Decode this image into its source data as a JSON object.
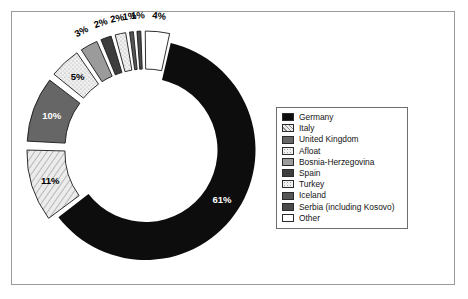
{
  "chart_data": {
    "type": "pie",
    "variant": "doughnut-exploded",
    "title": "",
    "xlabel": "",
    "ylabel": "",
    "units": "percent",
    "categories": [
      "Germany",
      "Italy",
      "United Kingdom",
      "Afloat",
      "Bosnia-Herzegovina",
      "Spain",
      "Turkey",
      "Iceland",
      "Serbia (including Kosovo)",
      "Other"
    ],
    "values": [
      61,
      11,
      10,
      5,
      3,
      2,
      2,
      1,
      1,
      4
    ],
    "data_labels": [
      "61%",
      "11%",
      "10%",
      "5%",
      "3%",
      "2%",
      "2%",
      "1%",
      "1%",
      "4%"
    ],
    "legend_position": "right",
    "grid": false,
    "slices": [
      {
        "label": "Germany",
        "value": 61,
        "data_label": "61%",
        "fill": "#0d0d0d",
        "pattern": "solid",
        "label_color": "light",
        "exploded": false
      },
      {
        "label": "Italy",
        "value": 11,
        "data_label": "11%",
        "fill": "#e8e8e8",
        "pattern": "diagonal-lines",
        "label_color": "dark",
        "exploded": true
      },
      {
        "label": "United Kingdom",
        "value": 10,
        "data_label": "10%",
        "fill": "#666666",
        "pattern": "solid",
        "label_color": "light",
        "exploded": true
      },
      {
        "label": "Afloat",
        "value": 5,
        "data_label": "5%",
        "fill": "#ececec",
        "pattern": "speckle",
        "label_color": "dark",
        "exploded": true
      },
      {
        "label": "Bosnia-Herzegovina",
        "value": 3,
        "data_label": "3%",
        "fill": "#9b9b9b",
        "pattern": "solid",
        "label_color": "dark",
        "exploded": true
      },
      {
        "label": "Spain",
        "value": 2,
        "data_label": "2%",
        "fill": "#3d3d3d",
        "pattern": "solid",
        "label_color": "dark",
        "exploded": true
      },
      {
        "label": "Turkey",
        "value": 2,
        "data_label": "2%",
        "fill": "#efefef",
        "pattern": "speckle",
        "label_color": "dark",
        "exploded": true
      },
      {
        "label": "Iceland",
        "value": 1,
        "data_label": "1%",
        "fill": "#565656",
        "pattern": "solid",
        "label_color": "dark",
        "exploded": true
      },
      {
        "label": "Serbia (including Kosovo)",
        "value": 1,
        "data_label": "1%",
        "fill": "#4a4a4a",
        "pattern": "solid",
        "label_color": "dark",
        "exploded": true
      },
      {
        "label": "Other",
        "value": 4,
        "data_label": "4%",
        "fill": "#ffffff",
        "pattern": "none",
        "label_color": "dark",
        "exploded": true
      }
    ]
  },
  "legend": {
    "items": [
      {
        "label": "Germany",
        "fill": "#0d0d0d",
        "pattern": "solid"
      },
      {
        "label": "Italy",
        "fill": "#e8e8e8",
        "pattern": "diagonal-lines"
      },
      {
        "label": "United Kingdom",
        "fill": "#666666",
        "pattern": "solid"
      },
      {
        "label": "Afloat",
        "fill": "#ececec",
        "pattern": "speckle"
      },
      {
        "label": "Bosnia-Herzegovina",
        "fill": "#9b9b9b",
        "pattern": "solid"
      },
      {
        "label": "Spain",
        "fill": "#3d3d3d",
        "pattern": "solid"
      },
      {
        "label": "Turkey",
        "fill": "#efefef",
        "pattern": "speckle"
      },
      {
        "label": "Iceland",
        "fill": "#565656",
        "pattern": "solid"
      },
      {
        "label": "Serbia (including Kosovo)",
        "fill": "#4a4a4a",
        "pattern": "solid"
      },
      {
        "label": "Other",
        "fill": "#ffffff",
        "pattern": "none"
      }
    ]
  },
  "colors": {
    "frame_border": "#9a9a9a",
    "legend_border": "#6e6e6e",
    "background": "#ffffff",
    "slice_outline": "#1a1a1a"
  }
}
